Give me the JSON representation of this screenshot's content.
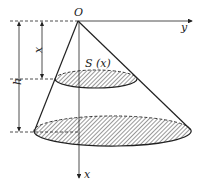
{
  "diagram": {
    "type": "cone-cross-section",
    "labels": {
      "origin": "O",
      "y_axis": "y",
      "x_axis": "x",
      "section_area": "S (x)",
      "depth": "x",
      "height": "h"
    },
    "colors": {
      "stroke": "#222222",
      "hatch": "#333333",
      "background": "#ffffff"
    }
  }
}
